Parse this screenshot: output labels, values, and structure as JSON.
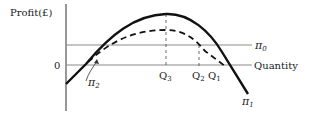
{
  "diagram": {
    "y_axis_label": "Profit(£)",
    "x_axis_label": "Quantity",
    "origin_label": "0",
    "pi0_label": "π",
    "pi0_sub": "0",
    "pi1_label": "π",
    "pi1_sub": "1",
    "pi2_label": "π",
    "pi2_sub": "2",
    "q3_label": "Q",
    "q3_sub": "3",
    "q2_label": "Q",
    "q2_sub": "2",
    "q1_label": "Q",
    "q1_sub": "1",
    "colors": {
      "ink": "#1a1a1a",
      "grid": "#9a9a9a",
      "background": "#ffffff"
    }
  }
}
